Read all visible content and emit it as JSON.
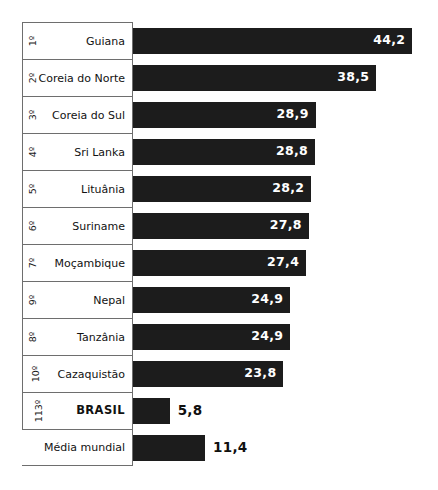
{
  "chart_data": {
    "type": "bar",
    "orientation": "horizontal",
    "title": "",
    "subtitle": "",
    "xlabel": "",
    "ylabel": "",
    "xlim": [
      0,
      46
    ],
    "grid": false,
    "legend": null,
    "value_format": "comma-decimal",
    "categories": [
      "Guiana",
      "Coreia do Norte",
      "Coreia do Sul",
      "Sri Lanka",
      "Lituânia",
      "Suriname",
      "Moçambique",
      "Nepal",
      "Tanzânia",
      "Cazaquistão",
      "BRASIL",
      "Média mundial"
    ],
    "values": [
      44.2,
      38.5,
      28.9,
      28.8,
      28.2,
      27.8,
      27.4,
      24.9,
      24.9,
      23.8,
      5.8,
      11.4
    ],
    "value_labels": [
      "44,2",
      "38,5",
      "28,9",
      "28,8",
      "28,2",
      "27,8",
      "27,4",
      "24,9",
      "24,9",
      "23,8",
      "5,8",
      "11,4"
    ],
    "rank_labels": [
      "1º",
      "2º",
      "3º",
      "4º",
      "5º",
      "6º",
      "7º",
      "9º",
      "8º",
      "10º",
      "113º",
      ""
    ]
  },
  "rows": [
    {
      "rank": "1º",
      "country": "Guiana",
      "value": 44.2,
      "value_label": "44,2",
      "label_inside": true,
      "highlight": false,
      "has_rank": true
    },
    {
      "rank": "2º",
      "country": "Coreia do Norte",
      "value": 38.5,
      "value_label": "38,5",
      "label_inside": true,
      "highlight": false,
      "has_rank": true
    },
    {
      "rank": "3º",
      "country": "Coreia do Sul",
      "value": 28.9,
      "value_label": "28,9",
      "label_inside": true,
      "highlight": false,
      "has_rank": true
    },
    {
      "rank": "4º",
      "country": "Sri Lanka",
      "value": 28.8,
      "value_label": "28,8",
      "label_inside": true,
      "highlight": false,
      "has_rank": true
    },
    {
      "rank": "5º",
      "country": "Lituânia",
      "value": 28.2,
      "value_label": "28,2",
      "label_inside": true,
      "highlight": false,
      "has_rank": true
    },
    {
      "rank": "6º",
      "country": "Suriname",
      "value": 27.8,
      "value_label": "27,8",
      "label_inside": true,
      "highlight": false,
      "has_rank": true
    },
    {
      "rank": "7º",
      "country": "Moçambique",
      "value": 27.4,
      "value_label": "27,4",
      "label_inside": true,
      "highlight": false,
      "has_rank": true
    },
    {
      "rank": "9º",
      "country": "Nepal",
      "value": 24.9,
      "value_label": "24,9",
      "label_inside": true,
      "highlight": false,
      "has_rank": true
    },
    {
      "rank": "8º",
      "country": "Tanzânia",
      "value": 24.9,
      "value_label": "24,9",
      "label_inside": true,
      "highlight": false,
      "has_rank": true
    },
    {
      "rank": "10º",
      "country": "Cazaquistão",
      "value": 23.8,
      "value_label": "23,8",
      "label_inside": true,
      "highlight": false,
      "has_rank": true
    },
    {
      "rank": "113º",
      "country": "BRASIL",
      "value": 5.8,
      "value_label": "5,8",
      "label_inside": false,
      "highlight": true,
      "has_rank": true
    },
    {
      "rank": "",
      "country": "Média mundial",
      "value": 11.4,
      "value_label": "11,4",
      "label_inside": false,
      "highlight": false,
      "has_rank": false
    }
  ],
  "style": {
    "bar_color": "#1c1c1c",
    "border_color": "#6e6e6e",
    "background": "#ffffff",
    "inside_label_color": "#ffffff",
    "outside_label_color": "#101010",
    "px_per_unit": 6.32
  }
}
